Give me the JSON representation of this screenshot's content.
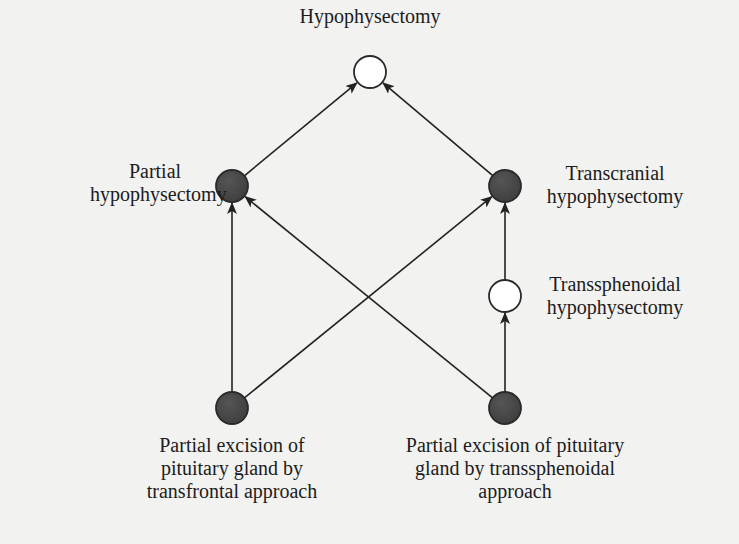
{
  "diagram": {
    "type": "directed-graph",
    "colors": {
      "background": "#f2f2f0",
      "filled_node": "#4a4a4a",
      "open_node": "#ffffff",
      "edge": "#222222"
    },
    "nodes": [
      {
        "id": "hypophysectomy",
        "label_lines": [
          "Hypophysectomy"
        ],
        "fill": "open",
        "x": 370,
        "y": 72
      },
      {
        "id": "partial_hypophysectomy",
        "label_lines": [
          "Partial",
          "hypophysectomy"
        ],
        "fill": "filled",
        "x": 232,
        "y": 186
      },
      {
        "id": "transcranial_hypophysectomy",
        "label_lines": [
          "Transcranial",
          "hypophysectomy"
        ],
        "fill": "filled",
        "x": 505,
        "y": 186
      },
      {
        "id": "transsphenoidal_hypophysectomy",
        "label_lines": [
          "Transsphenoidal",
          "hypophysectomy"
        ],
        "fill": "open",
        "x": 505,
        "y": 296
      },
      {
        "id": "partial_excision_transfrontal",
        "label_lines": [
          "Partial excision of",
          "pituitary gland by",
          "transfrontal approach"
        ],
        "fill": "filled",
        "x": 232,
        "y": 408
      },
      {
        "id": "partial_excision_transsphenoidal",
        "label_lines": [
          "Partial excision of pituitary",
          "gland by transsphenoidal",
          "approach"
        ],
        "fill": "filled",
        "x": 505,
        "y": 408
      }
    ],
    "edges": [
      {
        "from": "partial_hypophysectomy",
        "to": "hypophysectomy"
      },
      {
        "from": "transcranial_hypophysectomy",
        "to": "hypophysectomy"
      },
      {
        "from": "partial_excision_transfrontal",
        "to": "partial_hypophysectomy"
      },
      {
        "from": "partial_excision_transfrontal",
        "to": "transcranial_hypophysectomy"
      },
      {
        "from": "partial_excision_transsphenoidal",
        "to": "partial_hypophysectomy"
      },
      {
        "from": "partial_excision_transsphenoidal",
        "to": "transsphenoidal_hypophysectomy"
      },
      {
        "from": "transsphenoidal_hypophysectomy",
        "to": "transcranial_hypophysectomy"
      }
    ]
  },
  "labels": {
    "hypophysectomy": {
      "line1": "Hypophysectomy"
    },
    "partial_hypophysectomy": {
      "line1": "Partial",
      "line2": "hypophysectomy"
    },
    "transcranial_hypophysectomy": {
      "line1": "Transcranial",
      "line2": "hypophysectomy"
    },
    "transsphenoidal_hypophysectomy": {
      "line1": "Transsphenoidal",
      "line2": "hypophysectomy"
    },
    "partial_excision_transfrontal": {
      "line1": "Partial excision of",
      "line2": "pituitary gland by",
      "line3": "transfrontal approach"
    },
    "partial_excision_transsphenoidal": {
      "line1": "Partial excision of pituitary",
      "line2": "gland by transsphenoidal",
      "line3": "approach"
    }
  }
}
